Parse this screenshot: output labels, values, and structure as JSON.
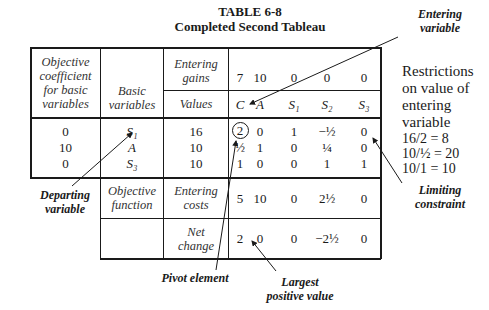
{
  "title": {
    "line1": "TABLE 6-8",
    "line2": "Completed Second Tableau"
  },
  "headers": {
    "col1": [
      "Objective",
      "coefficient",
      "for basic",
      "variables"
    ],
    "col2": [
      "Basic",
      "variables"
    ],
    "entering_gains": [
      "Entering",
      "gains"
    ],
    "values": "Values"
  },
  "entering_gains_row": [
    "7",
    "10",
    "0",
    "0",
    "0"
  ],
  "variables_row": [
    "C",
    "A",
    "S₁",
    "S₂",
    "S₃"
  ],
  "body": {
    "coefficients": [
      "0",
      "10",
      "0"
    ],
    "basic_variables": [
      "S₁",
      "A",
      "S₃"
    ],
    "values": [
      "16",
      "10",
      "10"
    ],
    "matrix": [
      [
        "2",
        "0",
        "1",
        "−½",
        "0"
      ],
      [
        "½",
        "1",
        "0",
        "¼",
        "0"
      ],
      [
        "1",
        "0",
        "0",
        "1",
        "1"
      ]
    ]
  },
  "objective_function_row": {
    "label": [
      "Objective",
      "function"
    ],
    "sublabel": [
      "Entering",
      "costs"
    ],
    "values": [
      "5",
      "10",
      "0",
      "2½",
      "0"
    ]
  },
  "net_change_row": {
    "sublabel": [
      "Net",
      "change"
    ],
    "values": [
      "2",
      "0",
      "0",
      "−2½",
      "0"
    ]
  },
  "restrictions": {
    "heading": [
      "Restrictions",
      "on value of",
      "entering",
      "variable"
    ],
    "ratios": [
      "16/2  = 8",
      "10/½ = 20",
      "10/1  = 10"
    ]
  },
  "annotations": {
    "entering_variable": [
      "Entering",
      "variable"
    ],
    "departing_variable": [
      "Departing",
      "variable"
    ],
    "pivot_element": "Pivot element",
    "largest_positive": [
      "Largest",
      "positive value"
    ],
    "limiting_constraint": [
      "Limiting",
      "constraint"
    ]
  }
}
